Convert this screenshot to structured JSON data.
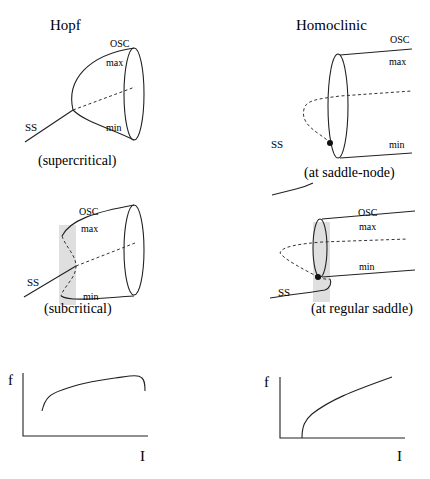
{
  "columns": {
    "left_title": "Hopf",
    "right_title": "Homoclinic"
  },
  "panels": {
    "hopf_supercritical": {
      "caption": "(supercritical)",
      "labels": {
        "osc": "OSC",
        "max": "max",
        "min": "min",
        "ss": "SS"
      }
    },
    "hopf_subcritical": {
      "caption": "(subcritical)",
      "labels": {
        "osc": "OSC",
        "max": "max",
        "min": "min",
        "ss": "SS"
      }
    },
    "homoclinic_saddle_node": {
      "caption": "(at saddle-node)",
      "labels": {
        "osc": "OSC",
        "max": "max",
        "min": "min",
        "ss": "SS"
      }
    },
    "homoclinic_regular_saddle": {
      "caption": "(at regular saddle)",
      "labels": {
        "osc": "OSC",
        "max": "max",
        "min": "min",
        "ss": "SS"
      }
    }
  },
  "fi_plots": {
    "hopf": {
      "ylabel": "f",
      "xlabel": "I"
    },
    "homoclinic": {
      "ylabel": "f",
      "xlabel": "I"
    }
  },
  "colors": {
    "ink": "#222222",
    "shade": "#d9d9d9",
    "background": "#ffffff"
  }
}
